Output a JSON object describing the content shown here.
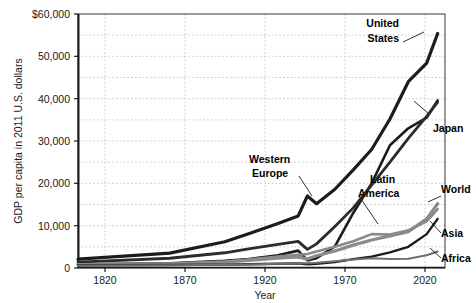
{
  "chart_data": {
    "type": "line",
    "title": "",
    "xlabel": "Year",
    "ylabel": "GDP per capita in 2011 U.S. dollars",
    "xlim": [
      1820,
      2020
    ],
    "ylim": [
      0,
      60000
    ],
    "xticks": [
      1820,
      1870,
      1920,
      1970,
      2020
    ],
    "xtick_labels": [
      "1820",
      "1870",
      "1920",
      "1970",
      "2020"
    ],
    "yticks": [
      0,
      10000,
      20000,
      30000,
      40000,
      50000,
      60000
    ],
    "ytick_labels": [
      "0",
      "10,000",
      "20,000",
      "30,000",
      "40,000",
      "50,000",
      "$60,000"
    ],
    "grid": "dotted minor gridlines every 5,000 vertical and every 25 years horizontal",
    "legend": "inline labels at end of each series",
    "x": [
      1820,
      1870,
      1900,
      1913,
      1929,
      1940,
      1945,
      1950,
      1960,
      1970,
      1980,
      1990,
      2000,
      2010,
      2016
    ],
    "series": [
      {
        "name": "United States",
        "color": "#1c1c1c",
        "width": 3.2,
        "values": [
          2100,
          3500,
          6200,
          8100,
          10500,
          12300,
          17000,
          15200,
          18600,
          23200,
          28000,
          35200,
          44000,
          48400,
          55400
        ]
      },
      {
        "name": "Japan",
        "color": "#1c1c1c",
        "width": 2.6,
        "values": [
          900,
          1100,
          1700,
          2100,
          3000,
          4100,
          1800,
          2300,
          5100,
          13000,
          20000,
          29000,
          33000,
          35500,
          39600
        ]
      },
      {
        "name": "Western Europe",
        "color": "#2c2c2c",
        "width": 2.8,
        "values": [
          1400,
          2300,
          3600,
          4500,
          5600,
          6300,
          4400,
          5700,
          9800,
          14200,
          19600,
          25000,
          30600,
          35800,
          39200
        ]
      },
      {
        "name": "World",
        "color": "#8a8a8a",
        "width": 3.2,
        "values": [
          800,
          1000,
          1400,
          1800,
          2300,
          2600,
          2100,
          2900,
          4000,
          5400,
          6600,
          7600,
          8600,
          11600,
          15200
        ]
      },
      {
        "name": "Latin America",
        "color": "#8a8a8a",
        "width": 2.6,
        "values": [
          750,
          950,
          1500,
          2000,
          2700,
          3100,
          3300,
          3900,
          5000,
          6300,
          8000,
          7900,
          8900,
          11000,
          13900
        ]
      },
      {
        "name": "Asia",
        "color": "#1c1c1c",
        "width": 2.4,
        "values": [
          650,
          700,
          800,
          900,
          1000,
          1100,
          900,
          1000,
          1400,
          2100,
          2700,
          3700,
          5000,
          8000,
          11600
        ]
      },
      {
        "name": "Africa",
        "color": "#6e6e6e",
        "width": 2.0,
        "values": [
          600,
          650,
          750,
          850,
          1000,
          1100,
          1150,
          1250,
          1600,
          2000,
          2300,
          2150,
          2200,
          3000,
          3900
        ]
      }
    ],
    "annotations": [
      {
        "label": "United States",
        "lines": [
          "United",
          "States"
        ]
      },
      {
        "label": "Japan",
        "lines": [
          "Japan"
        ]
      },
      {
        "label": "Western Europe",
        "lines": [
          "Western",
          "Europe"
        ]
      },
      {
        "label": "Latin America",
        "lines": [
          "Latin",
          "America"
        ]
      },
      {
        "label": "World",
        "lines": [
          "World"
        ]
      },
      {
        "label": "Asia",
        "lines": [
          "Asia"
        ]
      },
      {
        "label": "Africa",
        "lines": [
          "Africa"
        ]
      }
    ]
  },
  "axes": {
    "y_title": "GDP per capita in 2011 U.S. dollars",
    "x_title": "Year",
    "y_labels": {
      "t60000": "$60,000",
      "t50000": "50,000",
      "t40000": "40,000",
      "t30000": "30,000",
      "t20000": "20,000",
      "t10000": "10,000",
      "t0": "0"
    },
    "x_labels": {
      "t1820": "1820",
      "t1870": "1870",
      "t1920": "1920",
      "t1970": "1970",
      "t2020": "2020"
    }
  },
  "labels": {
    "united_states_1": "United",
    "united_states_2": "States",
    "japan": "Japan",
    "western_europe_1": "Western",
    "western_europe_2": "Europe",
    "latin_america_1": "Latin",
    "latin_america_2": "America",
    "world": "World",
    "asia": "Asia",
    "africa": "Africa"
  }
}
